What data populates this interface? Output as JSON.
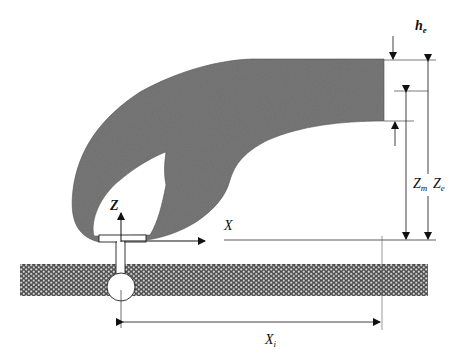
{
  "diagram": {
    "type": "plume-rise-schematic",
    "labels": {
      "h_e": "h",
      "h_e_sub": "e",
      "Z_m": "Z",
      "Z_m_sub": "m",
      "Z_e": "Z",
      "Z_e_sub": "e",
      "X_axis": "X",
      "Z_axis": "Z",
      "X_i": "X",
      "X_i_sub": "i"
    },
    "colors": {
      "plume": "#7a7a7a",
      "ground": "#6a6a6a",
      "line": "#222222",
      "background": "#ffffff"
    }
  }
}
